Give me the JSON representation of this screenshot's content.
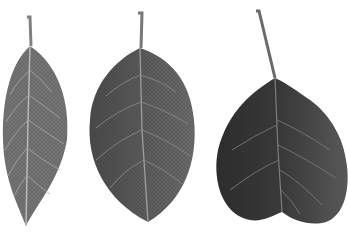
{
  "scene": {
    "description": "Three leaves on white background, left to right: narrow elliptic leaf, ovate leaf, heart-shaped dark leaf",
    "background": "#ffffff",
    "leaves": [
      {
        "name": "narrow-elliptic-leaf",
        "fill": "#6e6e6e",
        "vein": "#b4b4b4"
      },
      {
        "name": "ovate-leaf",
        "fill": "#5c5c5c",
        "vein": "#9a9a9a"
      },
      {
        "name": "cordate-leaf",
        "fill": "#3e3e3e",
        "vein": "#8a8a8a"
      }
    ]
  }
}
